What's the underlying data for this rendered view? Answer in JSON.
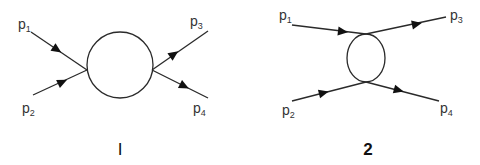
{
  "colors": {
    "line": "#2a2a2a",
    "arrow": "#111111",
    "text": "#333333",
    "background": "#ffffff"
  },
  "diagrams": [
    {
      "caption": "I",
      "loop": "circle",
      "legs": [
        {
          "label": "p",
          "subscript": "1",
          "direction": "incoming"
        },
        {
          "label": "p",
          "subscript": "2",
          "direction": "incoming"
        },
        {
          "label": "p",
          "subscript": "3",
          "direction": "outgoing"
        },
        {
          "label": "p",
          "subscript": "4",
          "direction": "outgoing"
        }
      ]
    },
    {
      "caption": "2",
      "loop": "ellipse",
      "legs": [
        {
          "label": "p",
          "subscript": "1",
          "direction": "incoming"
        },
        {
          "label": "p",
          "subscript": "2",
          "direction": "incoming"
        },
        {
          "label": "p",
          "subscript": "3",
          "direction": "outgoing"
        },
        {
          "label": "p",
          "subscript": "4",
          "direction": "outgoing"
        }
      ]
    }
  ]
}
